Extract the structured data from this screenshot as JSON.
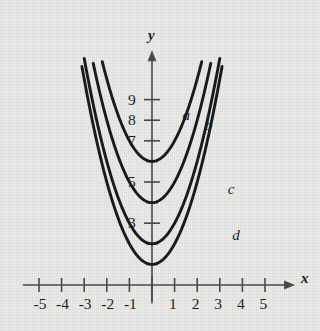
{
  "chart_data": {
    "type": "line",
    "title": "",
    "xlabel": "x",
    "ylabel": "y",
    "xlim": [
      -5.8,
      5.8
    ],
    "ylim": [
      -0.9,
      11.2
    ],
    "grid": false,
    "legend_position": "inline-curve-labels",
    "x_tick_labels": [
      "-5",
      "-4",
      "-3",
      "-2",
      "-1",
      "1",
      "2",
      "3",
      "4",
      "5"
    ],
    "x_tick_values": [
      -5,
      -4,
      -3,
      -2,
      -1,
      1,
      2,
      3,
      4,
      5
    ],
    "y_tick_labels": [
      "9",
      "8",
      "7",
      "5",
      "3"
    ],
    "y_tick_values": [
      9,
      8,
      7,
      5,
      3
    ],
    "y_tick_values_unlabeled": [
      1,
      2,
      4,
      6
    ],
    "series": [
      {
        "name": "a",
        "label": "a",
        "vertex": [
          0,
          6
        ],
        "equation": "y = x^2 + 6",
        "x_start": -2.2,
        "x_end": 2.2
      },
      {
        "name": "b",
        "label": "b",
        "vertex": [
          0,
          4
        ],
        "equation": "y = x^2 + 4",
        "x_start": -2.6,
        "x_end": 2.6
      },
      {
        "name": "c",
        "label": "c",
        "vertex": [
          0,
          2
        ],
        "equation": "y = x^2 + 2",
        "x_start": -3.0,
        "x_end": 3.0
      },
      {
        "name": "d",
        "label": "d",
        "vertex": [
          0,
          1
        ],
        "equation": "y = x^2 + 1",
        "x_start": -3.1,
        "x_end": 3.1
      }
    ],
    "curve_labels": [
      {
        "text": "a",
        "x": 1.35,
        "y": 8.6
      },
      {
        "text": "b",
        "x": 2.35,
        "y": 8.1
      },
      {
        "text": "c",
        "x": 3.35,
        "y": 5.0
      },
      {
        "text": "d",
        "x": 3.55,
        "y": 2.75
      }
    ],
    "axis_labels": {
      "x": "x",
      "y": "y"
    },
    "colors": {
      "background": "#e9e9e7",
      "curve": "#1a1a1a",
      "axis": "#4a4a4a",
      "text": "#1d1d1d"
    }
  }
}
